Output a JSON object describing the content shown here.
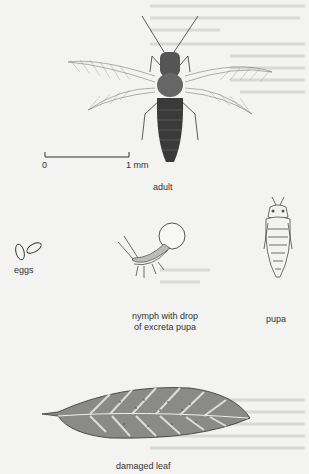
{
  "figure": {
    "scale_bar": {
      "start_label": "0",
      "end_label": "1 mm"
    },
    "labels": {
      "adult": "adult",
      "eggs": "eggs",
      "nymph_line1": "nymph with drop",
      "nymph_line2": "of excreta pupa",
      "pupa": "pupa",
      "leaf": "damaged leaf"
    }
  },
  "colors": {
    "background": "#f3f3f1",
    "ink": "#2a2a2a"
  }
}
